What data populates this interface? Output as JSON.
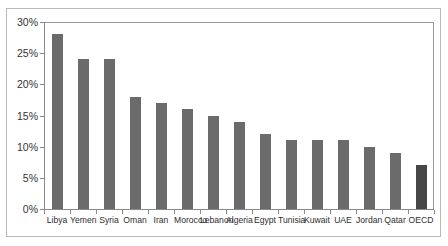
{
  "figure": {
    "title": "",
    "frame_color": "#b9b9b9",
    "background": "#ffffff"
  },
  "axes": {
    "y_ticks": [
      "30%",
      "25%",
      "20%",
      "15%",
      "10%",
      "5%",
      "0%"
    ],
    "bar_color": "#6b6b6b",
    "highlight_color": "#474747",
    "axis_color": "#8a8a8a"
  },
  "chart_data": {
    "type": "bar",
    "title": "",
    "xlabel": "",
    "ylabel": "",
    "ylim": [
      0,
      30
    ],
    "ytick_values": [
      30,
      25,
      20,
      15,
      10,
      5,
      0
    ],
    "ytick_labels": [
      "30%",
      "25%",
      "20%",
      "15%",
      "10%",
      "5%",
      "0%"
    ],
    "grid": false,
    "legend": null,
    "units": "percent",
    "categories": [
      "Libya",
      "Yemen",
      "Syria",
      "Oman",
      "Iran",
      "Morocco",
      "Lebanon",
      "Algeria",
      "Egypt",
      "Tunisia",
      "Kuwait",
      "UAE",
      "Jordan",
      "Qatar",
      "OECD"
    ],
    "values": [
      28,
      24,
      24,
      18,
      17,
      16,
      15,
      14,
      12,
      11,
      11,
      11,
      10,
      9,
      7
    ],
    "highlight_index": 14,
    "series": [
      {
        "name": "Share",
        "values": [
          28,
          24,
          24,
          18,
          17,
          16,
          15,
          14,
          12,
          11,
          11,
          11,
          10,
          9,
          7
        ]
      }
    ]
  }
}
